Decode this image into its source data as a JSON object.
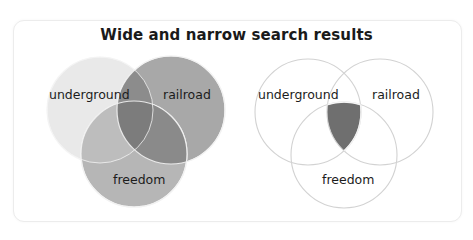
{
  "title": "Wide and narrow search results",
  "colors": {
    "card_border": "#ececec",
    "underground_fill": "#e9e9e9",
    "railroad_fill": "#a8a8a8",
    "freedom_fill": "#b6b6b6",
    "overlap_dark": "#8a8a8a",
    "triple_overlap": "#7a7a7a",
    "narrow_highlight": "#6f6f6f",
    "outline": "#d4d4d4"
  },
  "wide_diagram": {
    "name": "Wide search (OR)",
    "circles": [
      {
        "label": "underground",
        "cx": 100,
        "cy": 110,
        "r": 53
      },
      {
        "label": "railroad",
        "cx": 171,
        "cy": 110,
        "r": 54
      },
      {
        "label": "freedom",
        "cx": 134,
        "cy": 154,
        "r": 53
      }
    ],
    "labels": {
      "underground": "underground",
      "railroad": "railroad",
      "freedom": "freedom"
    }
  },
  "narrow_diagram": {
    "name": "Narrow search (AND)",
    "circles": [
      {
        "label": "underground",
        "cx": 308,
        "cy": 112,
        "r": 53
      },
      {
        "label": "railroad",
        "cx": 380,
        "cy": 112,
        "r": 53
      },
      {
        "label": "freedom",
        "cx": 344,
        "cy": 155,
        "r": 53
      }
    ],
    "labels": {
      "underground": "underground",
      "railroad": "railroad",
      "freedom": "freedom"
    }
  }
}
